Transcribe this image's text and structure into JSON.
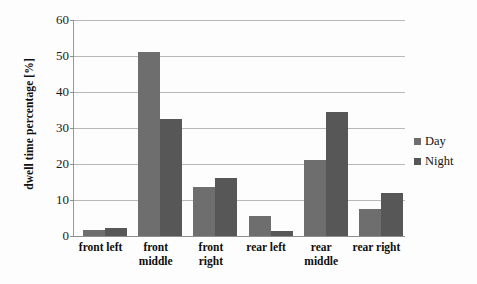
{
  "chart_data": {
    "type": "bar",
    "title": "",
    "xlabel": "",
    "ylabel": "dwell time percentage [%]",
    "ylim": [
      0,
      60
    ],
    "yticks": [
      0,
      10,
      20,
      30,
      40,
      50,
      60
    ],
    "grid": true,
    "legend_position": "right",
    "categories": [
      "front left",
      "front middle",
      "front right",
      "rear left",
      "rear middle",
      "rear right"
    ],
    "category_lines": [
      [
        "front left",
        ""
      ],
      [
        "front",
        "middle"
      ],
      [
        "front",
        "right"
      ],
      [
        "rear left",
        ""
      ],
      [
        "rear",
        "middle"
      ],
      [
        "rear right",
        ""
      ]
    ],
    "series": [
      {
        "name": "Day",
        "color": "#6e6e6e",
        "values": [
          1.8,
          51.0,
          13.5,
          5.5,
          21.0,
          7.5
        ]
      },
      {
        "name": "Night",
        "color": "#575757",
        "values": [
          2.3,
          32.5,
          16.0,
          1.5,
          34.5,
          12.0
        ]
      }
    ]
  },
  "axis": {
    "y_title": "dwell time percentage [%]",
    "y_tick_labels": [
      "60",
      "50",
      "40",
      "30",
      "20",
      "10",
      "0"
    ]
  },
  "legend": {
    "items": [
      {
        "label": "Day",
        "color": "#6e6e6e"
      },
      {
        "label": "Night",
        "color": "#575757"
      }
    ]
  }
}
